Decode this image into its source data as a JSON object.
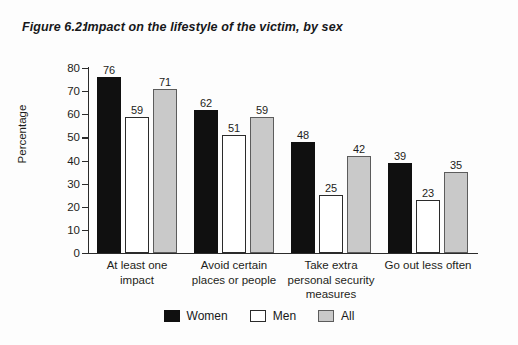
{
  "figure": {
    "number_label": "Figure 6.2:",
    "title": "Impact on the lifestyle of the victim, by sex"
  },
  "chart_data": {
    "type": "bar",
    "title": "Impact on the lifestyle of the victim, by sex",
    "xlabel": "",
    "ylabel": "Percentage",
    "ylim": [
      0,
      80
    ],
    "ytick_step": 10,
    "yticks": [
      80,
      70,
      60,
      50,
      40,
      30,
      20,
      10,
      0
    ],
    "grid": false,
    "legend_position": "bottom-center",
    "categories": [
      "At least one impact",
      "Avoid certain places or people",
      "Take extra personal security measures",
      "Go out less often"
    ],
    "category_lines": [
      [
        "At least one",
        "impact"
      ],
      [
        "Avoid certain",
        "places or people"
      ],
      [
        "Take extra",
        "personal security",
        "measures"
      ],
      [
        "Go out less often"
      ]
    ],
    "series": [
      {
        "name": "Women",
        "color": "#101010",
        "values": [
          76,
          62,
          48,
          39
        ]
      },
      {
        "name": "Men",
        "color": "#ffffff",
        "values": [
          59,
          51,
          25,
          23
        ]
      },
      {
        "name": "All",
        "color": "#c9c9c9",
        "values": [
          71,
          59,
          42,
          35
        ]
      }
    ]
  },
  "legend": {
    "items": [
      {
        "label": "Women",
        "swatch": "black-square-swatch"
      },
      {
        "label": "Men",
        "swatch": "white-square-swatch"
      },
      {
        "label": "All",
        "swatch": "gray-square-swatch"
      }
    ]
  }
}
